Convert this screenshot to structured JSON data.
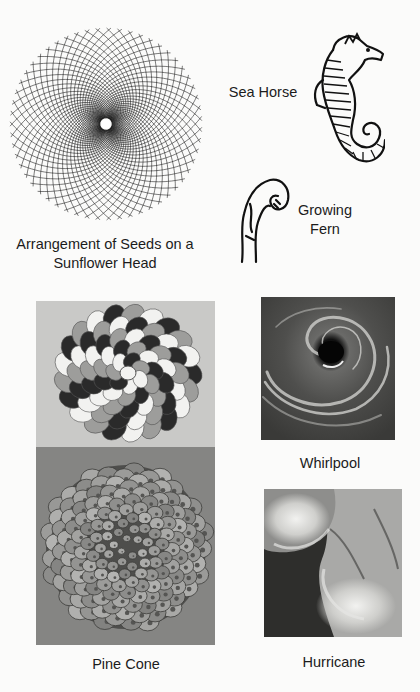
{
  "figures": {
    "sunflower": {
      "caption_line1": "Arrangement of Seeds on a",
      "caption_line2": "Sunflower Head",
      "spiral_count": 55
    },
    "seahorse": {
      "caption": "Sea Horse"
    },
    "fern": {
      "caption_line1": "Growing",
      "caption_line2": "Fern"
    },
    "spiral_diagram": {
      "caption": ""
    },
    "pine_cone": {
      "caption": "Pine Cone"
    },
    "whirlpool": {
      "caption": "Whirlpool"
    },
    "hurricane": {
      "caption": "Hurricane"
    }
  },
  "colors": {
    "page_bg": "#fbfbfa",
    "line_art": "#111111",
    "spiral_bg": "#c9c9c7",
    "spiral_dark": "#2a2a2a",
    "spiral_mid": "#9d9d9b",
    "spiral_light": "#f2f2f0",
    "pinecone_bg": "#858583",
    "whirlpool_bg": "#4a4a48",
    "hurricane_bg": "#5a5a58"
  }
}
